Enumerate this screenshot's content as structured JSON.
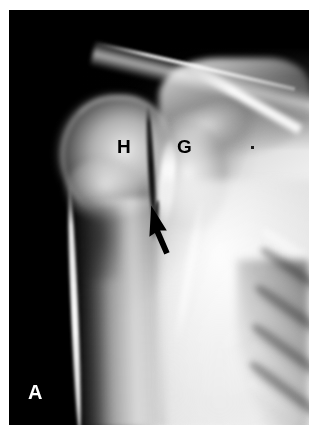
{
  "figure": {
    "panel_letter": "A",
    "modality": "radiograph",
    "view": "shoulder anteroposterior",
    "background_color": "#000000",
    "border_color": "#ffffff",
    "annotation_color": "#000000",
    "panel_letter_color": "#ffffff"
  },
  "annotations": {
    "labels": [
      {
        "id": "humeral-head",
        "text": "H",
        "x": 117,
        "y": 137
      },
      {
        "id": "glenoid",
        "text": "G",
        "x": 177,
        "y": 137
      }
    ],
    "arrow": {
      "id": "joint-space-arrow",
      "color": "#000000",
      "direction": "up-left",
      "tip_x": 151,
      "tip_y": 206,
      "tail_x": 168,
      "tail_y": 253
    },
    "marker_dot": {
      "x": 251,
      "y": 146,
      "color": "#1a1a1a"
    }
  },
  "anatomy": [
    {
      "id": "clavicle",
      "label": "clavicle"
    },
    {
      "id": "acromion",
      "label": "acromion"
    },
    {
      "id": "coracoid",
      "label": "coracoid process"
    },
    {
      "id": "humeral-head",
      "label": "humeral head"
    },
    {
      "id": "greater-tuberosity",
      "label": "greater tuberosity"
    },
    {
      "id": "humeral-shaft",
      "label": "humeral shaft"
    },
    {
      "id": "glenoid",
      "label": "glenoid"
    },
    {
      "id": "scapula-body",
      "label": "scapular body"
    },
    {
      "id": "joint-space",
      "label": "glenohumeral joint space"
    },
    {
      "id": "ribs",
      "label": "ribs"
    }
  ],
  "ribs": [
    {
      "top": 236,
      "left": 246,
      "width": 86,
      "height": 17,
      "rotate": 34
    },
    {
      "top": 274,
      "left": 240,
      "width": 92,
      "height": 18,
      "rotate": 35
    },
    {
      "top": 314,
      "left": 236,
      "width": 96,
      "height": 18,
      "rotate": 36
    },
    {
      "top": 354,
      "left": 232,
      "width": 98,
      "height": 18,
      "rotate": 37
    },
    {
      "top": 392,
      "left": 230,
      "width": 98,
      "height": 18,
      "rotate": 38
    }
  ],
  "rib_gaps": [
    {
      "top": 256,
      "left": 244,
      "width": 90,
      "height": 15,
      "rotate": 34
    },
    {
      "top": 295,
      "left": 238,
      "width": 94,
      "height": 16,
      "rotate": 35
    },
    {
      "top": 335,
      "left": 234,
      "width": 96,
      "height": 16,
      "rotate": 36
    },
    {
      "top": 374,
      "left": 231,
      "width": 98,
      "height": 16,
      "rotate": 37
    }
  ]
}
